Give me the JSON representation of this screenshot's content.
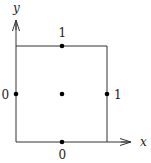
{
  "diagram": {
    "axes": {
      "x_label": "x",
      "y_label": "y"
    },
    "square": {
      "corners": [
        [
          16,
          46
        ],
        [
          107,
          46
        ],
        [
          107,
          142
        ],
        [
          16,
          142
        ]
      ],
      "stroke": "#333333"
    },
    "points": [
      {
        "name": "top-midpoint",
        "cx": 62,
        "cy": 46
      },
      {
        "name": "left-midpoint",
        "cx": 16,
        "cy": 94
      },
      {
        "name": "center",
        "cx": 62,
        "cy": 94
      },
      {
        "name": "right-midpoint",
        "cx": 107,
        "cy": 94
      },
      {
        "name": "bottom-midpoint",
        "cx": 62,
        "cy": 142
      }
    ],
    "edge_labels": {
      "top": "1",
      "left": "0",
      "right": "1",
      "bottom": "0"
    },
    "colors": {
      "line": "#333333",
      "point": "#000000",
      "text": "#222222"
    }
  }
}
